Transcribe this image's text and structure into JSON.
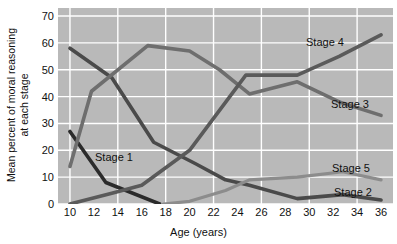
{
  "chart_data": {
    "type": "line",
    "title": "",
    "xlabel": "Age (years)",
    "ylabel": "Mean percent of moral reasoning at each stage",
    "ylabel_line1": "Mean percent of moral reasoning",
    "ylabel_line2": "at each stage",
    "xlim": [
      9,
      37
    ],
    "ylim": [
      0,
      73
    ],
    "yticks": [
      0,
      10,
      20,
      30,
      40,
      50,
      60,
      70
    ],
    "xticks": [
      10,
      12,
      14,
      16,
      18,
      20,
      22,
      24,
      26,
      28,
      30,
      32,
      34,
      36
    ],
    "grid": true,
    "grid_color": "#ffffff",
    "plot_background": "#b9b9b9",
    "legend_position": "inline-labels",
    "series": [
      {
        "name": "Stage 1",
        "label": "Stage 1",
        "color": "#2b2b2b",
        "width": 3.6,
        "x": [
          10,
          13,
          17.5
        ],
        "values": [
          27,
          8,
          0
        ]
      },
      {
        "name": "Stage 2",
        "label": "Stage 2",
        "color": "#4a4a4a",
        "width": 3.6,
        "x": [
          10,
          13.5,
          17,
          20.5,
          23,
          25,
          29,
          32.8,
          36
        ],
        "values": [
          58,
          47,
          23,
          15,
          9,
          7,
          2,
          3.5,
          1.5
        ]
      },
      {
        "name": "Stage 3",
        "label": "Stage 3",
        "color": "#6e6e6e",
        "width": 3.6,
        "x": [
          10,
          11.8,
          16.5,
          20,
          22.5,
          25,
          29,
          32.5,
          36
        ],
        "values": [
          14,
          42,
          59,
          57,
          50,
          41,
          45.5,
          38,
          33
        ]
      },
      {
        "name": "Stage 4",
        "label": "Stage 4",
        "color": "#5a5a5a",
        "width": 3.6,
        "x": [
          10,
          13.5,
          16,
          20,
          24.7,
          28,
          29,
          32.5,
          36
        ],
        "values": [
          0,
          4,
          7,
          20,
          48,
          48,
          48,
          55,
          63
        ]
      },
      {
        "name": "Stage 5",
        "label": "Stage 5",
        "color": "#8c8c8c",
        "width": 3.2,
        "x": [
          17.8,
          20,
          23,
          25,
          29,
          32.8,
          36
        ],
        "values": [
          0,
          1,
          5,
          9,
          10,
          12,
          9
        ]
      }
    ],
    "series_labels": [
      {
        "text": "Stage 1",
        "x_px": 95,
        "y_px": 151
      },
      {
        "text": "Stage 4",
        "x_px": 306,
        "y_px": 36
      },
      {
        "text": "Stage 3",
        "x_px": 331,
        "y_px": 98
      },
      {
        "text": "Stage 5",
        "x_px": 332,
        "y_px": 162
      },
      {
        "text": "Stage 2",
        "x_px": 334,
        "y_px": 186
      }
    ]
  }
}
